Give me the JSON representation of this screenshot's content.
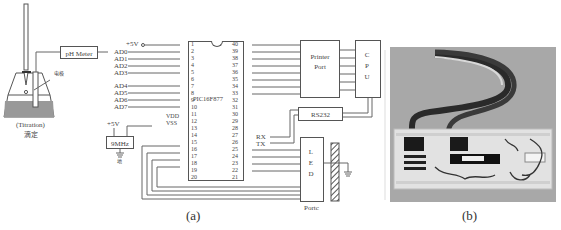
{
  "figure": {
    "panel_a": {
      "caption": "(a)",
      "titration": {
        "label_en": "(Titration)",
        "label_cn": "滴定",
        "electrode_label": "电极"
      },
      "ph_meter": {
        "label": "pH Meter"
      },
      "power": {
        "vcc_label": "+5V"
      },
      "oscillator": {
        "label": "9MHz",
        "vcc_label": "+5V",
        "ground_label": "地"
      },
      "mcu": {
        "label": "PIC16F877",
        "left_pins": [
          "1",
          "2",
          "3",
          "4",
          "5",
          "6",
          "7",
          "8",
          "9",
          "10",
          "11",
          "12",
          "13",
          "14",
          "15",
          "16",
          "17",
          "18",
          "19",
          "20"
        ],
        "right_pins": [
          "40",
          "39",
          "38",
          "37",
          "36",
          "35",
          "34",
          "33",
          "32",
          "31",
          "30",
          "29",
          "28",
          "27",
          "26",
          "25",
          "24",
          "23",
          "22",
          "21"
        ]
      },
      "analog_inputs": [
        "AD0",
        "AD1",
        "AD2",
        "AD3",
        "AD4",
        "AD5",
        "AD6",
        "AD7"
      ],
      "supply_pins": [
        "VDD",
        "VSS"
      ],
      "serial": {
        "rx": "RX",
        "tx": "TX"
      },
      "printer_port": {
        "label_line1": "Printer",
        "label_line2": "Port"
      },
      "cpu": {
        "label": "CPU"
      },
      "rs232": {
        "label": "RS232"
      },
      "led": {
        "label": "LED",
        "port_label": "Portc"
      }
    },
    "panel_b": {
      "caption": "(b)",
      "description": "Photograph of breadboard prototype with ribbon cable"
    }
  }
}
